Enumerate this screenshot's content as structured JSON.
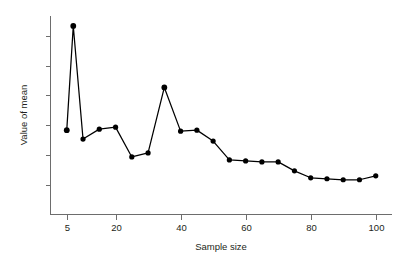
{
  "chart_data": {
    "type": "line",
    "title": "",
    "xlabel": "Sample size",
    "ylabel": "Value of mean",
    "xlim": [
      0,
      105
    ],
    "ylim": [
      0,
      10
    ],
    "grid": false,
    "legend": false,
    "marker": "filled-circle",
    "line_color": "#000000",
    "marker_color": "#000000",
    "axis_color": "#6d6d6d",
    "x_ticks": [
      5,
      20,
      40,
      60,
      80,
      100
    ],
    "x_tick_labels": [
      "5",
      "20",
      "40",
      "60",
      "80",
      "100"
    ],
    "y_ticks": [
      1.5,
      3.0,
      4.5,
      6.0,
      7.5,
      9.0
    ],
    "y_tick_labels": [
      "",
      "",
      "",
      "",
      "",
      ""
    ],
    "x": [
      5,
      7,
      10,
      15,
      20,
      25,
      30,
      35,
      40,
      45,
      50,
      55,
      60,
      65,
      70,
      75,
      80,
      85,
      90,
      95,
      100
    ],
    "values": [
      4.25,
      9.5,
      3.8,
      4.3,
      4.4,
      2.9,
      3.1,
      6.4,
      4.2,
      4.25,
      3.7,
      2.75,
      2.7,
      2.65,
      2.65,
      2.2,
      1.85,
      1.8,
      1.75,
      1.75,
      1.95
    ],
    "series": [
      {
        "name": "Value of mean",
        "x": [
          5,
          7,
          10,
          15,
          20,
          25,
          30,
          35,
          40,
          45,
          50,
          55,
          60,
          65,
          70,
          75,
          80,
          85,
          90,
          95,
          100
        ],
        "values": [
          4.25,
          9.5,
          3.8,
          4.3,
          4.4,
          2.9,
          3.1,
          6.4,
          4.2,
          4.25,
          3.7,
          2.75,
          2.7,
          2.65,
          2.65,
          2.2,
          1.85,
          1.8,
          1.75,
          1.75,
          1.95
        ]
      }
    ]
  }
}
